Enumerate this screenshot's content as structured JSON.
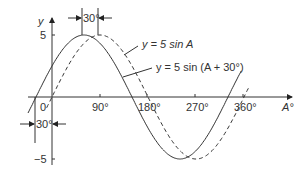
{
  "chart_data": {
    "type": "line",
    "title": "",
    "xlabel": "A°",
    "ylabel": "y",
    "x_ticks": [
      "0",
      "90°",
      "180°",
      "270°",
      "360°"
    ],
    "y_ticks": [
      "5",
      "−5"
    ],
    "xlim": [
      -40,
      400
    ],
    "ylim": [
      -5,
      5
    ],
    "grid": false,
    "series": [
      {
        "name": "y = 5 sin A",
        "style": "dashed",
        "formula": "5*sin(A)",
        "x": [
          0,
          90,
          180,
          270,
          360
        ],
        "values": [
          0,
          5,
          0,
          -5,
          0
        ]
      },
      {
        "name": "y = 5 sin (A + 30°)",
        "style": "solid",
        "formula": "5*sin(A+30)",
        "x": [
          -30,
          60,
          150,
          240,
          330
        ],
        "values": [
          0,
          5,
          0,
          -5,
          0
        ]
      }
    ],
    "annotations": [
      {
        "text": "30°",
        "position": "top",
        "meaning": "phase shift between peaks"
      },
      {
        "text": "30°",
        "position": "left-below-axis",
        "meaning": "phase shift at zero crossing"
      }
    ]
  },
  "labels": {
    "y_axis": "y",
    "x_axis": "A°",
    "tick_0": "0",
    "tick_90": "90°",
    "tick_180": "180°",
    "tick_270": "270°",
    "tick_360": "360°",
    "tick_5": "5",
    "tick_neg5": "−5",
    "shift_top": "30°",
    "shift_bottom": "30°",
    "legend_1": "y = 5 sin A",
    "legend_2": "y = 5 sin (A + 30°)"
  }
}
